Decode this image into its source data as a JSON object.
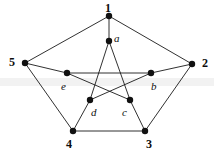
{
  "figure": {
    "background_color": "#ffffff",
    "edge_color": "#1a1a1a",
    "node_color": "#111111",
    "band_color": "#f2f2f2"
  },
  "labels": {
    "v1": "1",
    "v2": "2",
    "v3": "3",
    "v4": "4",
    "v5": "5",
    "a": "a",
    "b": "b",
    "c": "c",
    "d": "d",
    "e": "e"
  },
  "chart_data": {
    "type": "diagram",
    "nodes": [
      {
        "id": "1",
        "label": "1",
        "x": 109,
        "y": 16,
        "ring": "outer",
        "label_x": 105,
        "label_y": 2,
        "label_style": "bold"
      },
      {
        "id": "2",
        "label": "2",
        "x": 192,
        "y": 64,
        "ring": "outer",
        "label_x": 202,
        "label_y": 57,
        "label_style": "bold"
      },
      {
        "id": "3",
        "label": "3",
        "x": 145,
        "y": 131,
        "ring": "outer",
        "label_x": 146,
        "label_y": 138,
        "label_style": "bold"
      },
      {
        "id": "4",
        "label": "4",
        "x": 73,
        "y": 131,
        "ring": "outer",
        "label_x": 66,
        "label_y": 138,
        "label_style": "bold"
      },
      {
        "id": "5",
        "label": "5",
        "x": 25,
        "y": 63,
        "ring": "outer",
        "label_x": 9,
        "label_y": 56,
        "label_style": "bold"
      },
      {
        "id": "a",
        "label": "a",
        "x": 109,
        "y": 41,
        "ring": "inner",
        "label_x": 114,
        "label_y": 33,
        "label_style": "italic"
      },
      {
        "id": "b",
        "label": "b",
        "x": 151,
        "y": 73,
        "ring": "inner",
        "label_x": 151,
        "label_y": 81,
        "label_style": "italic"
      },
      {
        "id": "c",
        "label": "c",
        "x": 130,
        "y": 100,
        "ring": "inner",
        "label_x": 122,
        "label_y": 107,
        "label_style": "italic"
      },
      {
        "id": "d",
        "label": "d",
        "x": 90,
        "y": 100,
        "ring": "inner",
        "label_x": 91,
        "label_y": 107,
        "label_style": "italic"
      },
      {
        "id": "e",
        "label": "e",
        "x": 67,
        "y": 73,
        "ring": "inner",
        "label_x": 61,
        "label_y": 81,
        "label_style": "italic"
      }
    ],
    "edges": [
      {
        "from": "5",
        "to": "1",
        "group": "outer-cycle"
      },
      {
        "from": "1",
        "to": "2",
        "group": "outer-cycle"
      },
      {
        "from": "2",
        "to": "3",
        "group": "outer-cycle"
      },
      {
        "from": "3",
        "to": "4",
        "group": "outer-cycle"
      },
      {
        "from": "4",
        "to": "5",
        "group": "outer-cycle"
      },
      {
        "from": "1",
        "to": "a",
        "group": "spoke"
      },
      {
        "from": "2",
        "to": "b",
        "group": "spoke"
      },
      {
        "from": "3",
        "to": "c",
        "group": "spoke"
      },
      {
        "from": "4",
        "to": "d",
        "group": "spoke"
      },
      {
        "from": "5",
        "to": "e",
        "group": "spoke"
      },
      {
        "from": "a",
        "to": "c",
        "group": "inner-pentagram"
      },
      {
        "from": "c",
        "to": "e",
        "group": "inner-pentagram"
      },
      {
        "from": "e",
        "to": "b",
        "group": "inner-pentagram"
      },
      {
        "from": "b",
        "to": "d",
        "group": "inner-pentagram"
      },
      {
        "from": "d",
        "to": "a",
        "group": "inner-pentagram"
      }
    ],
    "node_radius": 3.2,
    "xlim": [
      0,
      214
    ],
    "ylim": [
      0,
      155
    ],
    "grid": false,
    "legend": "none"
  }
}
